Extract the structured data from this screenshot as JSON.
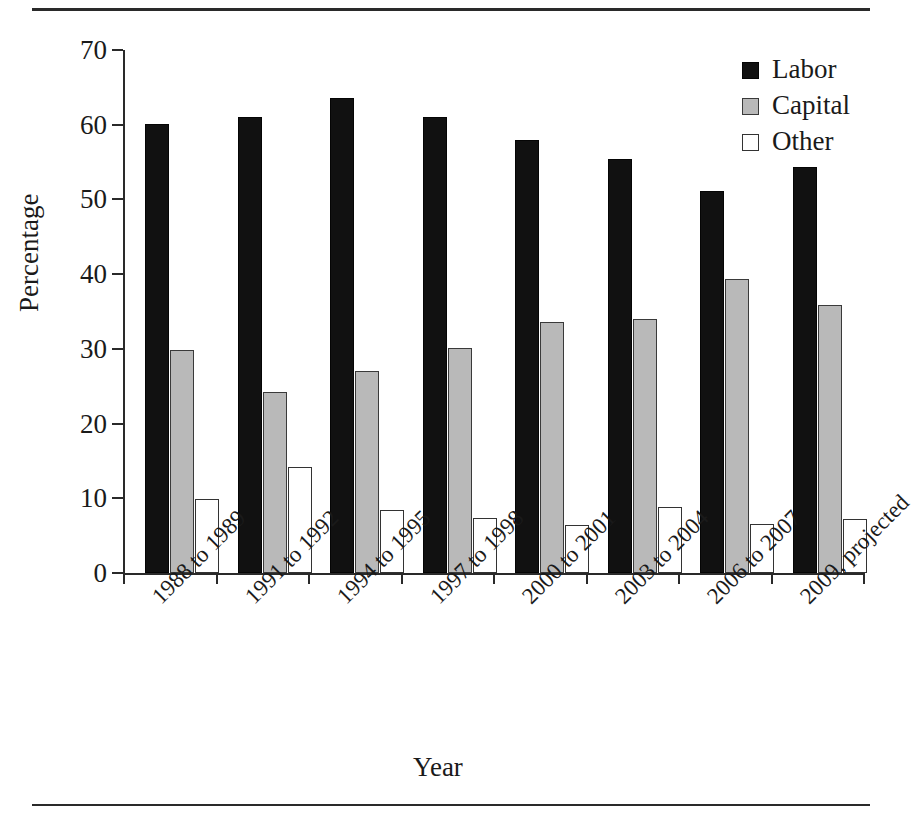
{
  "chart_data": {
    "type": "bar",
    "title": "",
    "xlabel": "Year",
    "ylabel": "Percentage",
    "ylim": [
      0,
      70
    ],
    "yticks": [
      0,
      10,
      20,
      30,
      40,
      50,
      60,
      70
    ],
    "grid": false,
    "legend_position": "top-right",
    "categories": [
      "1988 to 1989",
      "1991 to 1992",
      "1994 to 1995",
      "1997 to 1998",
      "2000 to 2001",
      "2003 to 2004",
      "2006 to 2007",
      "2009, projected"
    ],
    "series": [
      {
        "name": "Labor",
        "color": "#111111",
        "values": [
          60.1,
          61.0,
          63.6,
          61.1,
          58.0,
          55.4,
          51.1,
          54.3
        ]
      },
      {
        "name": "Capital",
        "color": "#b9b9b9",
        "values": [
          29.8,
          24.2,
          27.1,
          30.1,
          33.6,
          34.0,
          39.4,
          35.9
        ]
      },
      {
        "name": "Other",
        "color": "#ffffff",
        "values": [
          9.9,
          14.2,
          8.5,
          7.4,
          6.4,
          8.8,
          6.5,
          7.2
        ]
      }
    ]
  },
  "legend": {
    "items": [
      {
        "label": "Labor",
        "swatch": "labor"
      },
      {
        "label": "Capital",
        "swatch": "capital"
      },
      {
        "label": "Other",
        "swatch": "other"
      }
    ]
  },
  "axes": {
    "y_title": "Percentage",
    "x_title": "Year"
  }
}
